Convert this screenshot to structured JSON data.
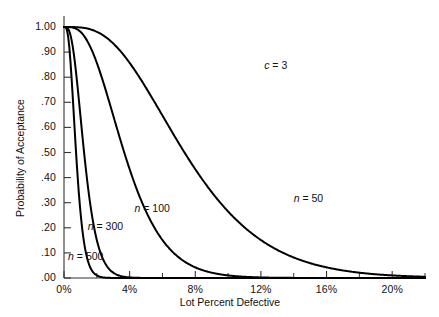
{
  "chart_data": {
    "type": "line",
    "title": "",
    "subtitle": "",
    "xlabel": "Lot Percent Defective",
    "ylabel": "Probability of Acceptance",
    "xlim": [
      0,
      22
    ],
    "ylim": [
      0,
      1.0
    ],
    "grid": false,
    "legend_position": "inline-annotations",
    "annotations": [
      {
        "text": "c = 3",
        "x": 12.2,
        "y": 0.845
      }
    ],
    "acceptance_number_c": 3,
    "xticks": [
      0,
      4,
      8,
      12,
      16,
      20
    ],
    "xtick_labels": [
      "0%",
      "4%",
      "8%",
      "12%",
      "16%",
      "20%"
    ],
    "xminor_ticks": [
      2,
      6,
      10,
      14,
      18,
      22
    ],
    "yticks": [
      0.0,
      0.1,
      0.2,
      0.3,
      0.4,
      0.5,
      0.6,
      0.7,
      0.8,
      0.9,
      1.0
    ],
    "ytick_labels": [
      ".00",
      ".10",
      ".20",
      ".30",
      ".40",
      ".50",
      ".60",
      ".70",
      ".80",
      ".90",
      "1.00"
    ],
    "series": [
      {
        "name": "n = 50",
        "label_text": "n = 50",
        "label_x": 14.0,
        "label_y": 0.315,
        "sample_size": 50,
        "x": [
          0,
          0.5,
          1.0,
          1.5,
          2.0,
          2.5,
          3.0,
          3.5,
          4.0,
          4.5,
          5.0,
          6.0,
          7.0,
          8.0,
          9.0,
          10.0,
          11.0,
          12.0,
          13.0,
          14.0,
          15.0,
          16.0,
          17.0,
          18.0,
          19.0,
          20.0,
          21.0,
          22.0
        ],
        "values": [
          1.0,
          1.0,
          0.998,
          0.991,
          0.982,
          0.962,
          0.937,
          0.903,
          0.861,
          0.815,
          0.76,
          0.647,
          0.532,
          0.422,
          0.327,
          0.25,
          0.185,
          0.135,
          0.098,
          0.07,
          0.049,
          0.034,
          0.024,
          0.016,
          0.011,
          0.007,
          0.005,
          0.003
        ]
      },
      {
        "name": "n = 100",
        "label_text": "n = 100",
        "label_x": 4.3,
        "label_y": 0.275,
        "sample_size": 100,
        "x": [
          0,
          0.25,
          0.5,
          0.75,
          1.0,
          1.25,
          1.5,
          1.75,
          2.0,
          2.5,
          3.0,
          3.5,
          4.0,
          4.5,
          5.0,
          5.5,
          6.0,
          6.5,
          7.0,
          8.0,
          9.0,
          10.0,
          11.0,
          12.0
        ],
        "values": [
          1.0,
          0.998,
          0.986,
          0.959,
          0.981,
          0.868,
          0.934,
          0.705,
          0.857,
          0.758,
          0.647,
          0.537,
          0.433,
          0.342,
          0.265,
          0.202,
          0.151,
          0.112,
          0.082,
          0.042,
          0.021,
          0.01,
          0.005,
          0.002
        ]
      },
      {
        "name": "n = 300",
        "label_text": "n = 300",
        "label_x": 1.45,
        "label_y": 0.205,
        "sample_size": 300,
        "x": [
          0,
          0.1,
          0.2,
          0.3,
          0.4,
          0.5,
          0.6,
          0.7,
          0.8,
          0.9,
          1.0,
          1.2,
          1.4,
          1.6,
          1.8,
          2.0,
          2.4,
          2.8,
          3.2,
          3.6,
          4.0
        ],
        "values": [
          1.0,
          0.979,
          0.938,
          0.847,
          0.734,
          0.616,
          0.502,
          0.397,
          0.308,
          0.234,
          0.175,
          0.093,
          0.047,
          0.023,
          0.011,
          0.005,
          0.001,
          0.0005,
          0.0002,
          0.0001,
          0.0
        ]
      },
      {
        "name": "n = 500",
        "label_text": "n = 500",
        "label_x": 0.25,
        "label_y": 0.082,
        "sample_size": 500,
        "x": [
          0,
          0.1,
          0.2,
          0.3,
          0.4,
          0.5,
          0.6,
          0.7,
          0.8,
          1.0,
          1.2,
          1.4,
          1.6,
          1.8,
          2.0,
          2.4,
          2.8
        ],
        "values": [
          1.0,
          0.92,
          0.736,
          0.514,
          0.326,
          0.194,
          0.109,
          0.059,
          0.031,
          0.008,
          0.002,
          0.0005,
          0.0001,
          0.0,
          0.0,
          0.0,
          0.0
        ]
      }
    ]
  },
  "axes": {
    "ylabel_text": "Probability of Acceptance",
    "xlabel_text": "Lot Percent Defective"
  },
  "colors": {
    "curve": "#000000",
    "axis": "#333333",
    "text": "#111111",
    "background": "#ffffff"
  }
}
